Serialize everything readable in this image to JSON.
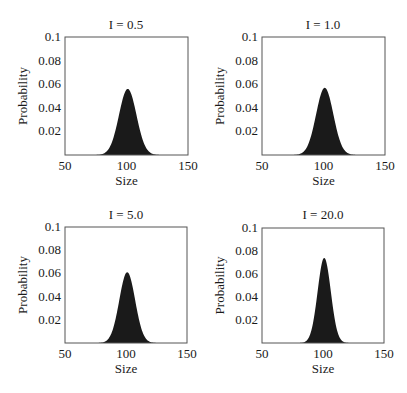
{
  "figure": {
    "layout": "2x2 grid",
    "xlabel": "Size",
    "ylabel": "Probability"
  },
  "chart_data": [
    {
      "type": "area",
      "title": "I = 0.5",
      "xlabel": "Size",
      "ylabel": "Probability",
      "xlim": [
        50,
        150
      ],
      "ylim": [
        0,
        0.1
      ],
      "xticks": [
        "50",
        "100",
        "150"
      ],
      "yticks": [
        "0.02",
        "0.04",
        "0.06",
        "0.08",
        "0.1"
      ],
      "grid": false,
      "distribution": {
        "shape": "bell",
        "mean": 101,
        "sd": 7.1,
        "peak": 0.056
      },
      "x": [
        70,
        80,
        85,
        90,
        95,
        100,
        101,
        105,
        110,
        115,
        120,
        130
      ],
      "values": [
        0.0,
        0.002,
        0.009,
        0.02,
        0.038,
        0.055,
        0.056,
        0.048,
        0.024,
        0.009,
        0.002,
        0.0
      ]
    },
    {
      "type": "area",
      "title": "I = 1.0",
      "xlabel": "Size",
      "ylabel": "Probability",
      "xlim": [
        50,
        150
      ],
      "ylim": [
        0,
        0.1
      ],
      "xticks": [
        "50",
        "100",
        "150"
      ],
      "yticks": [
        "0.02",
        "0.04",
        "0.06",
        "0.08",
        "0.1"
      ],
      "grid": false,
      "distribution": {
        "shape": "bell",
        "mean": 101,
        "sd": 7.0,
        "peak": 0.057
      },
      "x": [
        70,
        80,
        85,
        90,
        95,
        100,
        101,
        105,
        110,
        115,
        120,
        130
      ],
      "values": [
        0.0,
        0.002,
        0.009,
        0.021,
        0.039,
        0.056,
        0.057,
        0.049,
        0.025,
        0.008,
        0.002,
        0.0
      ]
    },
    {
      "type": "area",
      "title": "I = 5.0",
      "xlabel": "Size",
      "ylabel": "Probability",
      "xlim": [
        50,
        150
      ],
      "ylim": [
        0,
        0.1
      ],
      "xticks": [
        "50",
        "100",
        "150"
      ],
      "yticks": [
        "0.02",
        "0.04",
        "0.06",
        "0.08",
        "0.1"
      ],
      "grid": false,
      "distribution": {
        "shape": "bell",
        "mean": 101,
        "sd": 6.5,
        "peak": 0.061
      },
      "x": [
        70,
        80,
        85,
        90,
        95,
        100,
        101,
        105,
        110,
        115,
        120,
        130
      ],
      "values": [
        0.0,
        0.001,
        0.006,
        0.017,
        0.039,
        0.06,
        0.061,
        0.05,
        0.023,
        0.006,
        0.001,
        0.0
      ]
    },
    {
      "type": "area",
      "title": "I = 20.0",
      "xlabel": "Size",
      "ylabel": "Probability",
      "xlim": [
        50,
        150
      ],
      "ylim": [
        0,
        0.1
      ],
      "xticks": [
        "50",
        "100",
        "150"
      ],
      "yticks": [
        "0.02",
        "0.04",
        "0.06",
        "0.08",
        "0.1"
      ],
      "grid": false,
      "distribution": {
        "shape": "bell",
        "mean": 101,
        "sd": 5.4,
        "peak": 0.074
      },
      "x": [
        75,
        85,
        90,
        95,
        100,
        101,
        105,
        110,
        115,
        125
      ],
      "values": [
        0.0,
        0.002,
        0.011,
        0.04,
        0.073,
        0.074,
        0.057,
        0.019,
        0.003,
        0.0
      ]
    }
  ]
}
